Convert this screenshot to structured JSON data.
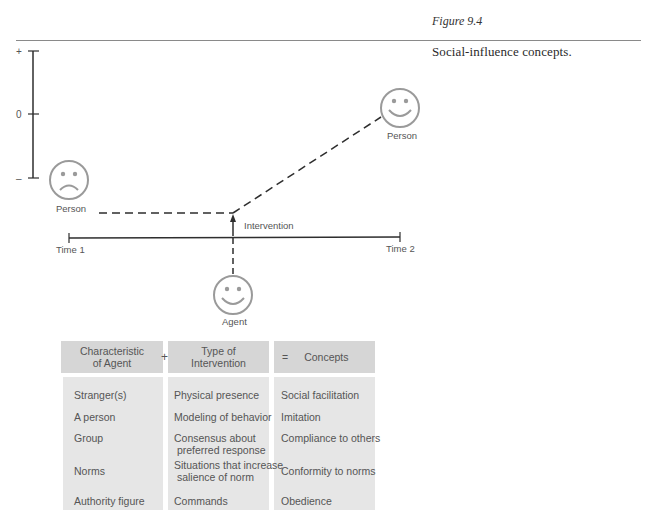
{
  "figure": {
    "label": "Figure 9.4",
    "caption": "Social-influence concepts."
  },
  "diagram": {
    "y_axis": {
      "ticks": [
        "+",
        "0",
        "–"
      ]
    },
    "time_axis": {
      "start_label": "Time 1",
      "end_label": "Time 2"
    },
    "intervention_label": "Intervention",
    "faces": [
      {
        "role": "person-before",
        "expression": "frown-face-icon",
        "label": "Person"
      },
      {
        "role": "person-after",
        "expression": "smile-face-icon",
        "label": "Person"
      },
      {
        "role": "agent",
        "expression": "smile-face-icon",
        "label": "Agent"
      }
    ],
    "colors": {
      "line": "#2e2e2e",
      "face": "#9a9a9a",
      "header_bg": "#d6d6d6",
      "cell_bg": "#e6e6e6"
    }
  },
  "table": {
    "headers": {
      "agent": "Characteristic\nof Agent",
      "plus": "+",
      "intervention": "Type of\nIntervention",
      "equals": "=",
      "concepts": "Concepts"
    },
    "rows": [
      {
        "agent": "Stranger(s)",
        "intervention": "Physical presence",
        "concept": "Social facilitation"
      },
      {
        "agent": "A person",
        "intervention": "Modeling of behavior",
        "concept": "Imitation"
      },
      {
        "agent": "Group",
        "intervention": "Consensus about\n preferred response",
        "concept": "Compliance to others"
      },
      {
        "agent": "Norms",
        "intervention": "Situations that increase\n salience of norm",
        "concept": "Conformity to norms"
      },
      {
        "agent": "Authority figure",
        "intervention": "Commands",
        "concept": "Obedience"
      }
    ]
  }
}
